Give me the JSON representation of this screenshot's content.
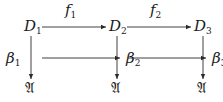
{
  "diagram": {
    "type": "commutative-diagram",
    "nodes": [
      {
        "id": "D1",
        "base": "D",
        "sub": "1",
        "x": 24,
        "y": 19
      },
      {
        "id": "D2",
        "base": "D",
        "sub": "2",
        "x": 109,
        "y": 19
      },
      {
        "id": "D3",
        "base": "D",
        "sub": "3",
        "x": 194,
        "y": 19
      },
      {
        "id": "A1",
        "glyph": "𝔄",
        "x": 25,
        "y": 81
      },
      {
        "id": "A2",
        "glyph": "𝔄",
        "x": 111,
        "y": 81
      },
      {
        "id": "A3",
        "glyph": "𝔄",
        "x": 197,
        "y": 81
      },
      {
        "id": "beta2",
        "base": "β",
        "sub": "2",
        "x": 126,
        "y": 51
      },
      {
        "id": "beta3",
        "base": "β",
        "sub": "3",
        "x": 212,
        "y": 51
      }
    ],
    "labels": [
      {
        "id": "f1",
        "base": "f",
        "sub": "1",
        "x": 65,
        "y": 3
      },
      {
        "id": "f2",
        "base": "f",
        "sub": "2",
        "x": 150,
        "y": 3
      },
      {
        "id": "beta1",
        "base": "β",
        "sub": "1",
        "x": 6,
        "y": 51
      }
    ],
    "arrows": [
      {
        "from": "D1",
        "to": "D2",
        "label": "f1",
        "x1": 42,
        "y1": 27,
        "x2": 106,
        "y2": 27
      },
      {
        "from": "D2",
        "to": "D3",
        "label": "f2",
        "x1": 127,
        "y1": 27,
        "x2": 191,
        "y2": 27
      },
      {
        "from": "D1",
        "to": "A1",
        "label": "beta1",
        "x1": 31,
        "y1": 36,
        "x2": 31,
        "y2": 79
      },
      {
        "from": "D2",
        "to": "A2",
        "x1": 117,
        "y1": 36,
        "x2": 117,
        "y2": 79
      },
      {
        "from": "D3",
        "to": "A3",
        "x1": 203,
        "y1": 36,
        "x2": 203,
        "y2": 79
      },
      {
        "from": "beta1-side",
        "to": "beta2",
        "x1": 42,
        "y1": 58,
        "x2": 120,
        "y2": 58
      },
      {
        "from": "beta2-side",
        "to": "beta3",
        "x1": 128,
        "y1": 58,
        "x2": 206,
        "y2": 58
      }
    ],
    "stroke_color": "#2a2a2a"
  }
}
